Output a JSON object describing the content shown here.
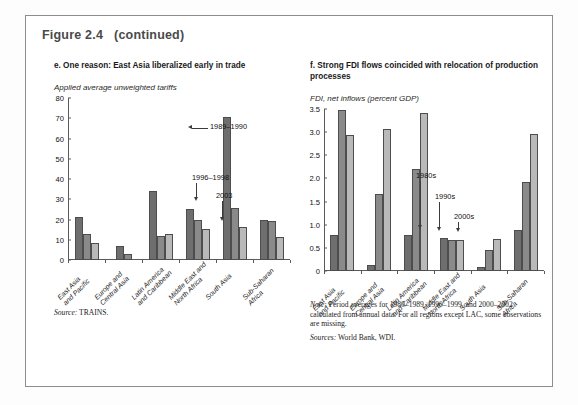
{
  "figure": {
    "number": "Figure 2.4",
    "continued": "(continued)"
  },
  "panels": [
    {
      "id": "panel-e",
      "title": "e. One reason: East Asia liberalized early in trade",
      "axis_caption": "Applied average unweighted tariffs",
      "source_label": "Source:",
      "source_value": "TRAINS.",
      "annotations": [
        {
          "label": "1989–1990"
        },
        {
          "label": "1996–1998"
        },
        {
          "label": "2003"
        }
      ]
    },
    {
      "id": "panel-f",
      "title": "f. Strong FDI flows coincided with relocation of production processes",
      "axis_caption": "FDI, net inflows (percent GDP)",
      "note_label": "Note:",
      "note_value": " Period averages for 1980–1989, 1990–1999, and 2000–2002 calculated from annual data. For all regions except LAC, some observations are missing.",
      "sources_label": "Sources:",
      "sources_value": " World Bank, WDI.",
      "annotations": [
        {
          "label": "1980s"
        },
        {
          "label": "1990s"
        },
        {
          "label": "2000s"
        }
      ]
    }
  ],
  "colors": {
    "series1": "#6e6e6e",
    "series2": "#8a8a8a",
    "series3": "#b9b9b9",
    "axis": "#5a5a5a",
    "border": "#8d8d8d",
    "title": "#4a4a4a"
  },
  "chart_data": [
    {
      "type": "bar",
      "id": "tariffs",
      "title": "e. One reason: East Asia liberalized early in trade",
      "ylabel": "Applied average unweighted tariffs",
      "xlabel": "",
      "ylim": [
        0,
        80
      ],
      "yticks": [
        0,
        10,
        20,
        30,
        40,
        50,
        60,
        70,
        80
      ],
      "grid": false,
      "legend": "annotated-arrows",
      "categories": [
        "East Asia and Pacific",
        "Europe and Central Asia",
        "Latin America and Caribbean",
        "Middle East and North Africa",
        "South Asia",
        "Sub-Saharan Africa"
      ],
      "category_lines": [
        [
          "East Asia",
          "and Pacific"
        ],
        [
          "Europe and",
          "Central Asia"
        ],
        [
          "Latin America",
          "and Caribbean"
        ],
        [
          "Middle East and",
          "North Africa"
        ],
        [
          "South Asia"
        ],
        [
          "Sub-Saharan",
          "Africa"
        ]
      ],
      "series": [
        {
          "name": "1989–1990",
          "values": [
            21.0,
            7.0,
            34.2,
            25.0,
            70.7,
            20.0
          ]
        },
        {
          "name": "1996–1998",
          "values": [
            13.0,
            3.2,
            12.0,
            19.8,
            25.8,
            19.5
          ]
        },
        {
          "name": "2003",
          "values": [
            8.5,
            0.0,
            12.9,
            15.5,
            16.4,
            11.4
          ]
        }
      ],
      "source": "Source: TRAINS."
    },
    {
      "type": "bar",
      "id": "fdi",
      "title": "f. Strong FDI flows coincided with relocation of production processes",
      "ylabel": "FDI, net inflows (percent GDP)",
      "xlabel": "",
      "ylim": [
        0,
        3.5
      ],
      "yticks": [
        0,
        0.5,
        1.0,
        1.5,
        2.0,
        2.5,
        3.0,
        3.5
      ],
      "ytick_labels": [
        "0",
        "0.5",
        "1.0",
        "1.5",
        "2.0",
        "2.5",
        "3.0",
        "3.5"
      ],
      "grid": false,
      "legend": "annotated-arrows",
      "categories": [
        "East Asia and Pacific",
        "Europe and Central Asia",
        "Latin America and Caribbean",
        "Middle East and North Africa",
        "South Asia",
        "Sub-Saharan Africa"
      ],
      "category_lines": [
        [
          "East Asia",
          "and Pacific"
        ],
        [
          "Europe and",
          "Central Asia"
        ],
        [
          "Latin America",
          "and Caribbean"
        ],
        [
          "Middle East and",
          "North Africa"
        ],
        [
          "South Asia"
        ],
        [
          "Sub-Saharan",
          "Africa"
        ]
      ],
      "series": [
        {
          "name": "1980s",
          "values": [
            0.78,
            0.12,
            0.78,
            0.71,
            0.08,
            0.89
          ]
        },
        {
          "name": "1990s",
          "values": [
            3.48,
            1.67,
            2.21,
            0.66,
            0.46,
            1.92
          ]
        },
        {
          "name": "2000s",
          "values": [
            2.93,
            3.06,
            3.41,
            0.67,
            0.69,
            2.95
          ]
        }
      ],
      "note": "Note: Period averages for 1980–1989, 1990–1999, and 2000–2002 calculated from annual data. For all regions except LAC, some observations are missing.",
      "sources": "Sources: World Bank, WDI."
    }
  ]
}
